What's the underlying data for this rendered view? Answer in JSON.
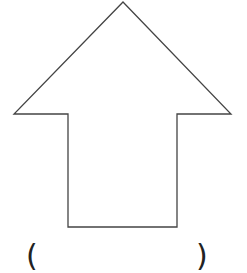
{
  "diagram": {
    "shape": "up-arrow",
    "stroke_color": "#444444",
    "fill_color": "#ffffff",
    "stroke_width": 1.3,
    "points": [
      [
        123,
        2
      ],
      [
        231,
        114
      ],
      [
        177,
        114
      ],
      [
        177,
        227
      ],
      [
        68,
        227
      ],
      [
        68,
        114
      ],
      [
        14,
        114
      ]
    ]
  },
  "caption": {
    "open_paren": "(",
    "close_paren": ")"
  }
}
